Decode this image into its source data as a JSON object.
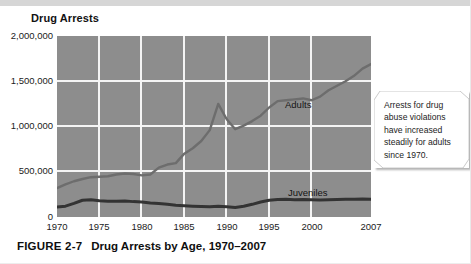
{
  "figure": {
    "chart_title": "Drug Arrests",
    "caption_label": "FIGURE 2-7",
    "caption_title": "Drug Arrests by Age, 1970–2007"
  },
  "callout": {
    "text": "Arrests for drug abuse violations have increased steadily for adults since 1970."
  },
  "colors": {
    "plot_background": "#8d8d8d",
    "gridline": "#f4f4f4",
    "adults_line": "#6d6d6d",
    "juveniles_line": "#333333",
    "page_background": "#ffffff",
    "text": "#1b1b1b"
  },
  "chart_data": {
    "type": "line",
    "title": "Drug Arrests",
    "xlabel": "",
    "ylabel": "Drug Arrests",
    "xlim": [
      1970,
      2007
    ],
    "ylim": [
      0,
      2000000
    ],
    "grid": true,
    "legend": "in-plot labels",
    "xticks": [
      "1970",
      "1975",
      "1980",
      "1985",
      "1990",
      "1995",
      "2000",
      "2007"
    ],
    "xtick_values": [
      1970,
      1975,
      1980,
      1985,
      1990,
      1995,
      2000,
      2007
    ],
    "yticks": [
      "0",
      "500,000",
      "1,000,000",
      "1,500,000",
      "2,000,000"
    ],
    "ytick_values": [
      0,
      500000,
      1000000,
      1500000,
      2000000
    ],
    "x": [
      1970,
      1971,
      1972,
      1973,
      1974,
      1975,
      1976,
      1977,
      1978,
      1979,
      1980,
      1981,
      1982,
      1983,
      1984,
      1985,
      1986,
      1987,
      1988,
      1989,
      1990,
      1991,
      1992,
      1993,
      1994,
      1995,
      1996,
      1997,
      1998,
      1999,
      2000,
      2001,
      2002,
      2003,
      2004,
      2005,
      2006,
      2007
    ],
    "series": [
      {
        "name": "Adults",
        "label": "Adults",
        "color": "#6d6d6d",
        "values": [
          320000,
          360000,
          395000,
          420000,
          440000,
          445000,
          450000,
          470000,
          480000,
          475000,
          460000,
          470000,
          545000,
          580000,
          595000,
          700000,
          760000,
          840000,
          960000,
          1250000,
          1080000,
          970000,
          1010000,
          1060000,
          1120000,
          1210000,
          1280000,
          1290000,
          1300000,
          1310000,
          1290000,
          1330000,
          1400000,
          1450000,
          1500000,
          1560000,
          1640000,
          1690000
        ]
      },
      {
        "name": "Juveniles",
        "label": "Juveniles",
        "color": "#333333",
        "values": [
          110000,
          120000,
          150000,
          185000,
          190000,
          180000,
          175000,
          175000,
          178000,
          170000,
          165000,
          155000,
          150000,
          140000,
          130000,
          125000,
          120000,
          115000,
          112000,
          118000,
          112000,
          105000,
          118000,
          140000,
          165000,
          185000,
          192000,
          195000,
          190000,
          192000,
          190000,
          188000,
          190000,
          192000,
          195000,
          196000,
          198000,
          197000
        ]
      }
    ],
    "annotations": [
      {
        "text": "Arrests for drug abuse violations have increased steadily for adults since 1970.",
        "type": "callout"
      }
    ]
  }
}
